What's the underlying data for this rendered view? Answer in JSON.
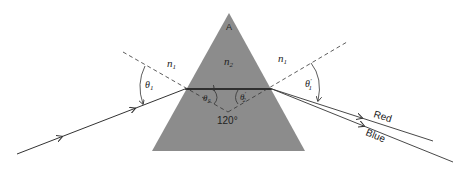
{
  "diagram": {
    "labels": {
      "apex": "A",
      "n_left": "n",
      "n_left_sub": "1",
      "n_prism": "n",
      "n_prism_sub": "2",
      "n_right": "n",
      "n_right_sub": "1",
      "theta1": "θ",
      "theta1_sub": "1",
      "theta2": "θ",
      "theta2_sub": "2",
      "theta2p": "θ",
      "theta2p_sub": "2",
      "theta2p_sup": "′",
      "theta1p": "θ",
      "theta1p_sub": "1",
      "theta1p_sup": "′",
      "angle_normals": "120°",
      "ray_red": "Red",
      "ray_blue": "Blue"
    },
    "colors": {
      "prism_fill": "#8c8c8c",
      "line": "#333333"
    }
  }
}
